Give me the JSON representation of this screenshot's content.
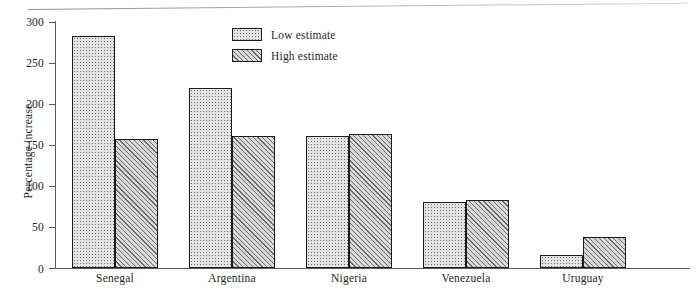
{
  "chart_data": {
    "type": "bar",
    "title": "",
    "xlabel": "",
    "ylabel": "Percentage increase",
    "categories": [
      "Senegal",
      "Argentina",
      "Nigeria",
      "Venezuela",
      "Uruguay"
    ],
    "series": [
      {
        "name": "Low estimate",
        "values": [
          282,
          219,
          161,
          80,
          16
        ]
      },
      {
        "name": "High estimate",
        "values": [
          157,
          161,
          163,
          83,
          38
        ]
      }
    ],
    "ylim": [
      0,
      300
    ],
    "yticks": [
      0,
      50,
      100,
      150,
      200,
      250,
      300
    ],
    "ytick_labels": [
      "0",
      "50",
      "100",
      "150",
      "200",
      "250",
      "300"
    ],
    "grid": false,
    "legend_position": "top-center",
    "legend": [
      {
        "label": "Low estimate",
        "pattern": "dotted"
      },
      {
        "label": "High estimate",
        "pattern": "diagonal-hatch"
      }
    ],
    "colors": {
      "low_fill": "#e4e4e4",
      "high_fill": "#d9d9d9",
      "bar_outline": "#1b1b1b",
      "axis": "#5a5a5a",
      "text": "#1f1f1f",
      "background": "#ffffff"
    }
  }
}
